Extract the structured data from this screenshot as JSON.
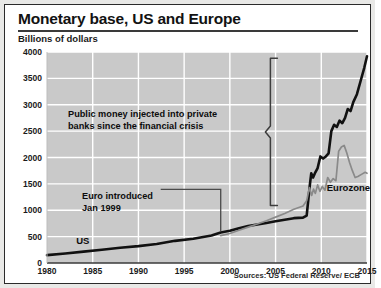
{
  "chart_data": {
    "type": "line",
    "title": "Monetary base, US and Europe",
    "ylabel": "Billions of dollars",
    "xlabel": "",
    "ylim": [
      0,
      4000
    ],
    "xlim": [
      1980,
      2015
    ],
    "yticks": [
      "0",
      "500",
      "1000",
      "1500",
      "2000",
      "2500",
      "3000",
      "3500",
      "4000"
    ],
    "ytick_values": [
      0,
      500,
      1000,
      1500,
      2000,
      2500,
      3000,
      3500,
      4000
    ],
    "xticks": [
      "1980",
      "1985",
      "1990",
      "1995",
      "2000",
      "2005",
      "2010",
      "2015"
    ],
    "xtick_values": [
      1980,
      1985,
      1990,
      1995,
      2000,
      2005,
      2010,
      2015
    ],
    "grid": true,
    "legend_position": "inline-labels",
    "plot_background": "#c9c9c9",
    "gridline_color": "#ffffff",
    "series": [
      {
        "name": "US",
        "color": "#111111",
        "label_x": 1983.2,
        "label_y": 300,
        "x": [
          1980,
          1982,
          1984,
          1986,
          1988,
          1990,
          1992,
          1994,
          1996,
          1998,
          1999,
          2000,
          2001,
          2002,
          2003,
          2004,
          2005,
          2006,
          2007,
          2008.0,
          2008.4,
          2008.75,
          2008.9,
          2009.1,
          2009.35,
          2009.6,
          2009.9,
          2010.2,
          2010.5,
          2010.8,
          2011.1,
          2011.4,
          2011.7,
          2012.0,
          2012.3,
          2012.6,
          2012.9,
          2013.2,
          2013.5,
          2013.9,
          2014.3,
          2014.7,
          2015.0
        ],
        "y": [
          150,
          180,
          215,
          250,
          290,
          320,
          360,
          420,
          460,
          520,
          580,
          610,
          660,
          700,
          730,
          760,
          790,
          820,
          850,
          860,
          900,
          1480,
          1700,
          1620,
          1720,
          1800,
          2020,
          1980,
          2020,
          2080,
          2500,
          2620,
          2580,
          2700,
          2650,
          2750,
          2920,
          2880,
          3050,
          3200,
          3450,
          3700,
          3920
        ]
      },
      {
        "name": "Eurozone",
        "color": "#8a8a8a",
        "label_x": 2010.6,
        "label_y": 1430,
        "x": [
          1999,
          2000,
          2001,
          2002,
          2003,
          2004,
          2005,
          2006,
          2007,
          2008.0,
          2008.4,
          2008.7,
          2008.95,
          2009.15,
          2009.35,
          2009.6,
          2009.85,
          2010.1,
          2010.4,
          2010.7,
          2011.0,
          2011.3,
          2011.6,
          2011.9,
          2012.2,
          2012.5,
          2012.8,
          2013.1,
          2013.4,
          2013.7,
          2014.0,
          2014.4,
          2014.8,
          2015.0
        ],
        "y": [
          520,
          560,
          620,
          680,
          740,
          800,
          870,
          940,
          1020,
          1080,
          1180,
          1430,
          1280,
          1400,
          1320,
          1480,
          1360,
          1450,
          1380,
          1620,
          1530,
          1600,
          1560,
          2120,
          2200,
          2230,
          2080,
          1900,
          1750,
          1620,
          1640,
          1680,
          1720,
          1700
        ]
      }
    ],
    "annotations": [
      {
        "id": "crisis-note",
        "lines": [
          "Public money injected into private",
          "banks since the financial crisis"
        ],
        "text": "Public money injected into private banks since the financial crisis",
        "marker": "curly-brace",
        "brace_top_value": 3880,
        "brace_bottom_value": 1090,
        "brace_x_value": 2005.2
      },
      {
        "id": "euro-note",
        "lines": [
          "Euro introduced",
          "Jan 1999"
        ],
        "text": "Euro introduced Jan 1999",
        "marker": "leader-line",
        "points_to_x": 1999,
        "points_to_y": 560
      }
    ],
    "source": "Sources: US Federal Reserve/ ECB"
  }
}
